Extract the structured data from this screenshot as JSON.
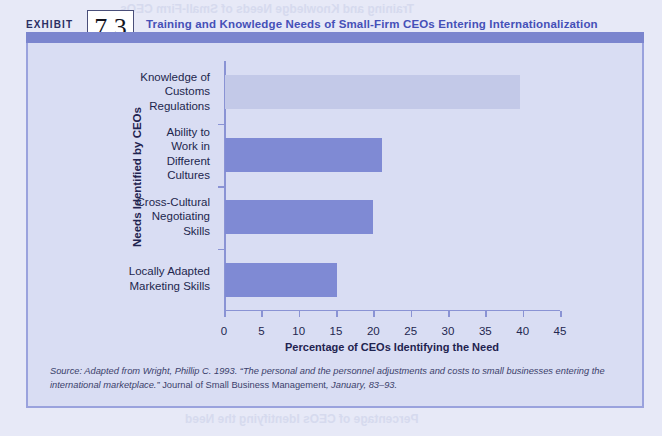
{
  "header": {
    "exhibit_word": "EXHIBIT",
    "exhibit_number": "7.3",
    "title": "Training and Knowledge Needs of Small-Firm CEOs Entering Internationalization"
  },
  "chart_data": {
    "type": "bar",
    "orientation": "horizontal",
    "title": "Training and Knowledge Needs of Small-Firm CEOs Entering Internationalization",
    "xlabel": "Percentage of CEOs Identifying the Need",
    "ylabel": "Needs Identified by CEOs",
    "xlim": [
      0,
      45
    ],
    "xticks": [
      0,
      5,
      10,
      15,
      20,
      25,
      30,
      35,
      40,
      45
    ],
    "grid": false,
    "legend": null,
    "bar_color": "#7f8ad4",
    "categories": [
      "Knowledge of Customs Regulations",
      "Ability to Work in Different Cultures",
      "Cross-Cultural Negotiating Skills",
      "Locally Adapted Marketing Skills"
    ],
    "category_lines": [
      [
        "Knowledge of",
        "Customs",
        "Regulations"
      ],
      [
        "Ability to",
        "Work in",
        "Different",
        "Cultures"
      ],
      [
        "Cross-Cultural",
        "Negotiating",
        "Skills"
      ],
      [
        "Locally Adapted",
        "Marketing Skills"
      ]
    ],
    "values": [
      39.5,
      21,
      19.8,
      15
    ]
  },
  "source": {
    "line1_italic_a": "Source: Adapted from Wright, Phillip C. 1993. “The personal and the personnel adjustments and costs to small businesses entering the international marketplace.” ",
    "line1_roman": "Journal of Small Business Management",
    "line1_italic_b": ", January, 83–93."
  },
  "artifacts": {
    "ghost_a": "Training and Knowledge Needs of Small-Firm CEOs",
    "ghost_b": "Training and Strategic Planning Advantages",
    "ghost_c": "in the Small-Firm Enterprise Management",
    "ghost_d": "Training and",
    "ghost_e": "Knowledge Needs",
    "ghost_f": "in Small Firms",
    "ghost_g": "Entering Markets",
    "ghost_h": "Small-Firm CEOs",
    "ghost_i": "Internationalization",
    "ghost_j": "Percentage of CEOs Identifying the Need"
  }
}
